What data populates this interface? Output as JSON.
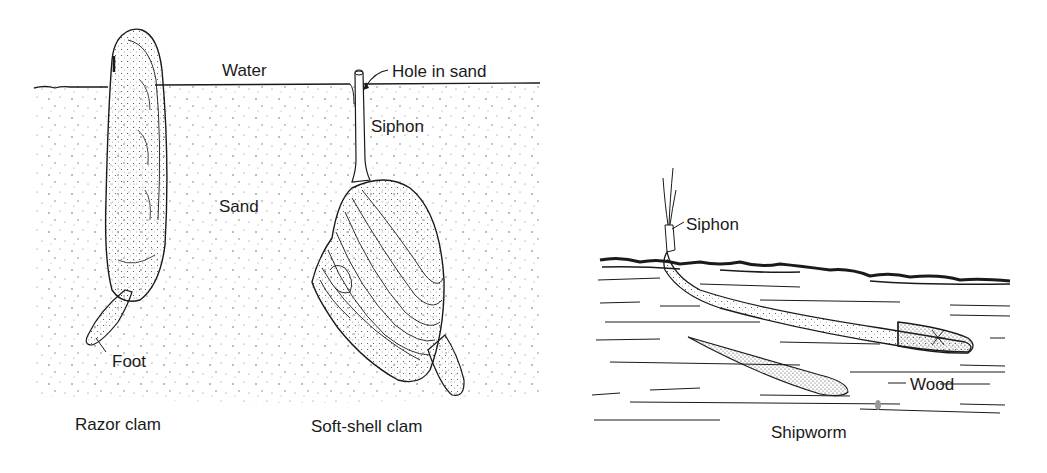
{
  "figure": {
    "left_panel": {
      "labels": {
        "water": "Water",
        "hole_in_sand": "Hole in sand",
        "siphon": "Siphon",
        "sand": "Sand",
        "foot": "Foot",
        "razor_clam": "Razor clam",
        "soft_shell_clam": "Soft-shell clam"
      }
    },
    "right_panel": {
      "labels": {
        "siphon": "Siphon",
        "wood": "Wood",
        "shipworm": "Shipworm"
      }
    },
    "colors": {
      "ink": "#1a1a1a",
      "background": "#ffffff",
      "stipple": "#555555"
    }
  }
}
